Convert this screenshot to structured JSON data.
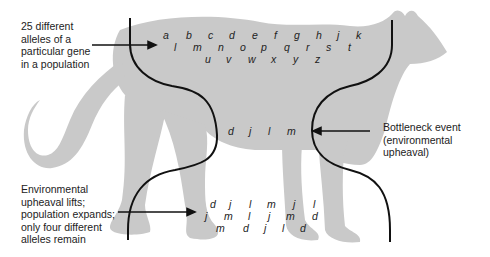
{
  "figure": {
    "labels": {
      "initial": "25 different\nalleles of a\nparticular gene\nin a population",
      "bottleneck": "Bottleneck event\n(environmental upheaval)",
      "recovery": "Environmental\nupheaval lifts;\npopulation expands;\nonly four different\nalleles remain"
    },
    "initial_alleles": {
      "row1": [
        "a",
        "b",
        "c",
        "d",
        "e",
        "f",
        "g",
        "h",
        "j",
        "k"
      ],
      "row2": [
        "l",
        "m",
        "n",
        "o",
        "p",
        "q",
        "r",
        "s",
        "t"
      ],
      "row3": [
        "u",
        "v",
        "w",
        "x",
        "y",
        "z"
      ]
    },
    "bottleneck_alleles": [
      "d",
      "j",
      "l",
      "m"
    ],
    "recovered_alleles": {
      "row1": [
        "d",
        "j",
        "l",
        "m",
        "j",
        "l"
      ],
      "row2": [
        "j",
        "m",
        "l",
        "j",
        "m",
        "d"
      ],
      "row3": [
        "m",
        "d",
        "j",
        "l",
        "d"
      ]
    },
    "colors": {
      "silhouette": "#c9c9c9",
      "line": "#111111",
      "text": "#222222"
    }
  }
}
